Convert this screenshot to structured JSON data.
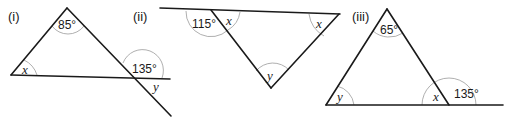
{
  "figures": [
    {
      "label": "(i)",
      "angles": {
        "apex": "85°",
        "left": "x",
        "exterior": "135°",
        "vertical": "y"
      }
    },
    {
      "label": "(ii)",
      "angles": {
        "exterior": "115°",
        "left_interior": "x",
        "right_interior": "x",
        "bottom": "y"
      }
    },
    {
      "label": "(iii)",
      "angles": {
        "apex": "65°",
        "left": "y",
        "right_interior": "x",
        "exterior": "135°"
      }
    }
  ]
}
